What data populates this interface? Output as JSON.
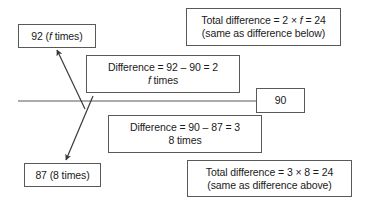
{
  "diagram": {
    "stroke_color": "#595959",
    "text_color": "#1a1a1a",
    "background_color": "#ffffff",
    "boxes": {
      "value_92": {
        "line1_pre": "92 (",
        "line1_italic": "f",
        "line1_post": " times)"
      },
      "total_difference_above": {
        "line1_pre": "Total difference = 2 × ",
        "line1_italic": "f",
        "line1_post": " = 24",
        "line2": "(same as difference below)"
      },
      "difference_upper": {
        "line1": "Difference = 92 – 90 = 2",
        "line2_italic": "f",
        "line2_post": " times"
      },
      "value_90": {
        "line1": "90"
      },
      "difference_lower": {
        "line1": "Difference = 90 – 87 = 3",
        "line2": "8 times"
      },
      "value_87": {
        "line1": "87 (8 times)"
      },
      "total_difference_below": {
        "line1": "Total difference = 3 × 8 = 24",
        "line2": "(same as difference above)"
      }
    },
    "connectors": {
      "baseline_label": "baseline",
      "arrow_up_label": "arrow to 92",
      "arrow_down_label": "arrow to 87"
    }
  }
}
